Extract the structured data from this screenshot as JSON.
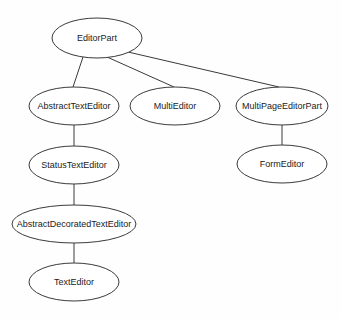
{
  "diagram": {
    "type": "class-hierarchy-tree",
    "nodes": [
      {
        "id": "EditorPart",
        "label": "EditorPart",
        "cx": 97,
        "cy": 38,
        "rx": 45,
        "ry": 20
      },
      {
        "id": "AbstractTextEditor",
        "label": "AbstractTextEditor",
        "cx": 74,
        "cy": 106,
        "rx": 45,
        "ry": 19
      },
      {
        "id": "MultiEditor",
        "label": "MultiEditor",
        "cx": 175,
        "cy": 106,
        "rx": 45,
        "ry": 19
      },
      {
        "id": "MultiPageEditorPart",
        "label": "MultiPageEditorPart",
        "cx": 282,
        "cy": 106,
        "rx": 46,
        "ry": 19
      },
      {
        "id": "StatusTextEditor",
        "label": "StatusTextEditor",
        "cx": 74,
        "cy": 165,
        "rx": 45,
        "ry": 19
      },
      {
        "id": "FormEditor",
        "label": "FormEditor",
        "cx": 282,
        "cy": 164,
        "rx": 45,
        "ry": 19
      },
      {
        "id": "AbstractDecoratedTextEditor",
        "label": "AbstractDecoratedTextEditor",
        "cx": 74,
        "cy": 224,
        "rx": 62,
        "ry": 19
      },
      {
        "id": "TextEditor",
        "label": "TextEditor",
        "cx": 74,
        "cy": 282,
        "rx": 45,
        "ry": 19
      }
    ],
    "edges": [
      {
        "from": "EditorPart",
        "to": "AbstractTextEditor",
        "x1": 83,
        "y1": 57,
        "x2": 73,
        "y2": 87
      },
      {
        "from": "EditorPart",
        "to": "MultiEditor",
        "x1": 107,
        "y1": 57,
        "x2": 174,
        "y2": 87
      },
      {
        "from": "EditorPart",
        "to": "MultiPageEditorPart",
        "x1": 128,
        "y1": 52,
        "x2": 279,
        "y2": 87
      },
      {
        "from": "AbstractTextEditor",
        "to": "StatusTextEditor",
        "x1": 74,
        "y1": 125,
        "x2": 74,
        "y2": 146
      },
      {
        "from": "MultiPageEditorPart",
        "to": "FormEditor",
        "x1": 282,
        "y1": 125,
        "x2": 282,
        "y2": 145
      },
      {
        "from": "StatusTextEditor",
        "to": "AbstractDecoratedTextEditor",
        "x1": 74,
        "y1": 184,
        "x2": 74,
        "y2": 205
      },
      {
        "from": "AbstractDecoratedTextEditor",
        "to": "TextEditor",
        "x1": 74,
        "y1": 243,
        "x2": 74,
        "y2": 263
      }
    ]
  }
}
